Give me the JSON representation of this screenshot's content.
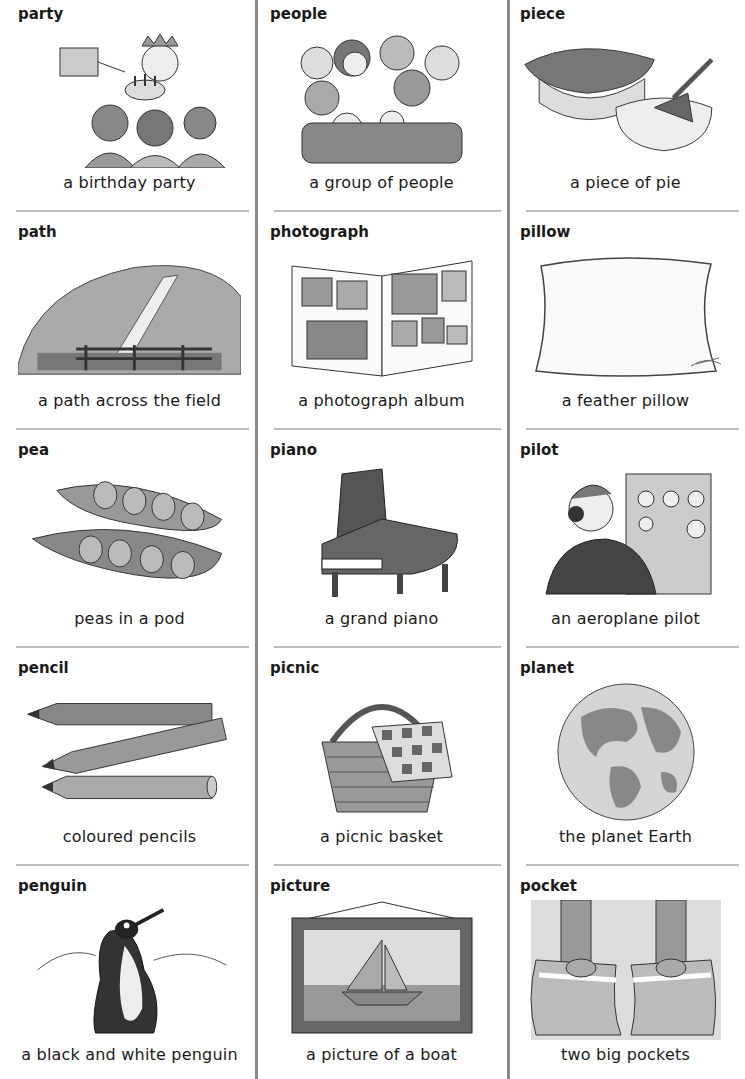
{
  "columns": [
    {
      "entries": [
        {
          "word": "party",
          "caption": "a birthday party",
          "illustration": "birthday-party-illustration"
        },
        {
          "word": "path",
          "caption": "a path across the field",
          "illustration": "field-path-illustration"
        },
        {
          "word": "pea",
          "caption": "peas in a pod",
          "illustration": "pea-pod-illustration"
        },
        {
          "word": "pencil",
          "caption": "coloured pencils",
          "illustration": "pencils-illustration"
        },
        {
          "word": "penguin",
          "caption": "a black and white penguin",
          "illustration": "penguin-illustration"
        }
      ]
    },
    {
      "entries": [
        {
          "word": "people",
          "caption": "a group of people",
          "illustration": "group-of-people-illustration"
        },
        {
          "word": "photograph",
          "caption": "a photograph album",
          "illustration": "photo-album-illustration"
        },
        {
          "word": "piano",
          "caption": "a grand piano",
          "illustration": "grand-piano-illustration"
        },
        {
          "word": "picnic",
          "caption": "a picnic basket",
          "illustration": "picnic-basket-illustration"
        },
        {
          "word": "picture",
          "caption": "a picture of a boat",
          "illustration": "boat-picture-illustration"
        }
      ]
    },
    {
      "entries": [
        {
          "word": "piece",
          "caption": "a piece of pie",
          "illustration": "pie-illustration"
        },
        {
          "word": "pillow",
          "caption": "a feather pillow",
          "illustration": "pillow-illustration"
        },
        {
          "word": "pilot",
          "caption": "an aeroplane pilot",
          "illustration": "pilot-illustration"
        },
        {
          "word": "planet",
          "caption": "the planet Earth",
          "illustration": "earth-illustration"
        },
        {
          "word": "pocket",
          "caption": "two big pockets",
          "illustration": "pockets-illustration"
        }
      ]
    }
  ]
}
